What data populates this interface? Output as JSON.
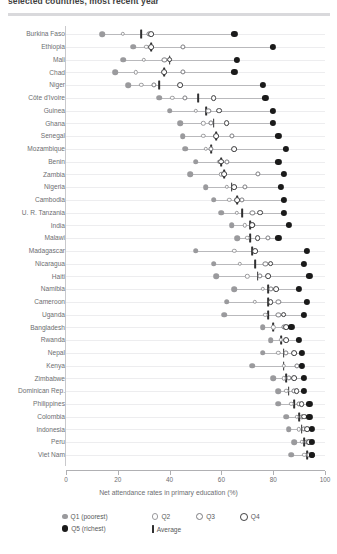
{
  "title": "selected countries, most recent year",
  "axis": {
    "x_title": "Net attendance rates in primary education (%)",
    "ticks": [
      0,
      20,
      40,
      60,
      80,
      100
    ],
    "xmin": 0,
    "xmax": 100
  },
  "legend": {
    "items": [
      {
        "key": "q1",
        "label": "Q1 (poorest)"
      },
      {
        "key": "q2",
        "label": "Q2"
      },
      {
        "key": "q3",
        "label": "Q3"
      },
      {
        "key": "q4",
        "label": "Q4"
      },
      {
        "key": "q5",
        "label": "Q5 (richest)"
      },
      {
        "key": "avg",
        "label": "Average"
      }
    ]
  },
  "colors": {
    "q1": "#9a9a9d",
    "q2": "#9a9a9d",
    "q3": "#7c7c80",
    "q4": "#3c3c3e",
    "q5": "#1a1a1a",
    "avg": "#303031",
    "connector": "#b9b9bc",
    "gridline": "#ededef",
    "axis": "#b0b0b3",
    "text": "#6d6e71",
    "rule": "#d9d9dc"
  },
  "chart_data": {
    "type": "scatter",
    "title": "selected countries, most recent year",
    "xlabel": "Net attendance rates in primary education (%)",
    "ylabel": "",
    "xlim": [
      0,
      100
    ],
    "grid": true,
    "legend_position": "bottom",
    "series_names": [
      "Q1 (poorest)",
      "Q2",
      "Q3",
      "Q4",
      "Q5 (richest)",
      "Average"
    ],
    "categories": [
      "Burkina Faso",
      "Ethiopia",
      "Mali",
      "Chad",
      "Niger",
      "Côte d'Ivoire",
      "Guinea",
      "Ghana",
      "Senegal",
      "Mozambique",
      "Benin",
      "Zambia",
      "Nigeria",
      "Cambodia",
      "U. R. Tanzania",
      "India",
      "Malawi",
      "Madagascar",
      "Nicaragua",
      "Haiti",
      "Namibia",
      "Cameroon",
      "Uganda",
      "Bangladesh",
      "Rwanda",
      "Nepal",
      "Kenya",
      "Zimbabwe",
      "Dominican Rep.",
      "Philippines",
      "Colombia",
      "Indonesia",
      "Peru",
      "Viet Nam"
    ],
    "rows": [
      {
        "country": "Burkina Faso",
        "q1": 14,
        "q2": 22,
        "q3": 32,
        "q4": 33,
        "q5": 65,
        "avg": 29
      },
      {
        "country": "Ethiopia",
        "q1": 26,
        "q2": 31,
        "q3": 45,
        "q4": 33,
        "q5": 80,
        "avg": 33
      },
      {
        "country": "Mali",
        "q1": 22,
        "q2": 30,
        "q3": 38,
        "q4": 40,
        "q5": 66,
        "avg": 40
      },
      {
        "country": "Chad",
        "q1": 19,
        "q2": 27,
        "q3": 45,
        "q4": 38,
        "q5": 65,
        "avg": 38
      },
      {
        "country": "Niger",
        "q1": 24,
        "q2": 29,
        "q3": 34,
        "q4": 44,
        "q5": 76,
        "avg": 36
      },
      {
        "country": "Côte d'Ivoire",
        "q1": 36,
        "q2": 41,
        "q3": 46,
        "q4": 57,
        "q5": 77,
        "avg": 51
      },
      {
        "country": "Guinea",
        "q1": 40,
        "q2": 50,
        "q3": 55,
        "q4": 59,
        "q5": 80,
        "avg": 54
      },
      {
        "country": "Ghana",
        "q1": 44,
        "q2": 53,
        "q3": 56,
        "q4": 62,
        "q5": 80,
        "avg": 57
      },
      {
        "country": "Senegal",
        "q1": 45,
        "q2": 53,
        "q3": 64,
        "q4": 58,
        "q5": 82,
        "avg": 58
      },
      {
        "country": "Mozambique",
        "q1": 46,
        "q2": 54,
        "q3": 56,
        "q4": 65,
        "q5": 85,
        "avg": 56
      },
      {
        "country": "Benin",
        "q1": 50,
        "q2": 59,
        "q3": 62,
        "q4": 60,
        "q5": 82,
        "avg": 60
      },
      {
        "country": "Zambia",
        "q1": 48,
        "q2": 60,
        "q3": 74,
        "q4": 61,
        "q5": 84,
        "avg": 61
      },
      {
        "country": "Nigeria",
        "q1": 54,
        "q2": 62,
        "q3": 69,
        "q4": 65,
        "q5": 83,
        "avg": 64
      },
      {
        "country": "Cambodia",
        "q1": 57,
        "q2": 63,
        "q3": 68,
        "q4": 66,
        "q5": 84,
        "avg": 66
      },
      {
        "country": "U. R. Tanzania",
        "q1": 60,
        "q2": 66,
        "q3": 72,
        "q4": 75,
        "q5": 84,
        "avg": 68
      },
      {
        "country": "India",
        "q1": 64,
        "q2": 69,
        "q3": 72,
        "q4": 72,
        "q5": 86,
        "avg": 71
      },
      {
        "country": "Malawi",
        "q1": 66,
        "q2": 70,
        "q3": 78,
        "q4": 74,
        "q5": 82,
        "avg": 71
      },
      {
        "country": "Madagascar",
        "q1": 50,
        "q2": 65,
        "q3": 73,
        "q4": 73,
        "q5": 93,
        "avg": 72
      },
      {
        "country": "Nicaragua",
        "q1": 57,
        "q2": 67,
        "q3": 77,
        "q4": 79,
        "q5": 92,
        "avg": 73
      },
      {
        "country": "Haiti",
        "q1": 58,
        "q2": 70,
        "q3": 75,
        "q4": 78,
        "q5": 94,
        "avg": 74
      },
      {
        "country": "Namibia",
        "q1": 65,
        "q2": 76,
        "q3": 79,
        "q4": 81,
        "q5": 90,
        "avg": 78
      },
      {
        "country": "Cameroon",
        "q1": 62,
        "q2": 73,
        "q3": 82,
        "q4": 79,
        "q5": 93,
        "avg": 78
      },
      {
        "country": "Uganda",
        "q1": 61,
        "q2": 77,
        "q3": 82,
        "q4": 84,
        "q5": 92,
        "avg": 78
      },
      {
        "country": "Bangladesh",
        "q1": 76,
        "q2": 80,
        "q3": 84,
        "q4": 85,
        "q5": 87,
        "avg": 80
      },
      {
        "country": "Rwanda",
        "q1": 79,
        "q2": 83,
        "q3": 85,
        "q4": 85,
        "q5": 90,
        "avg": 83
      },
      {
        "country": "Nepal",
        "q1": 76,
        "q2": 82,
        "q3": 85,
        "q4": 88,
        "q5": 91,
        "avg": 84
      },
      {
        "country": "Kenya",
        "q1": 72,
        "q2": 84,
        "q3": 89,
        "q4": 91,
        "q5": 91,
        "avg": 84
      },
      {
        "country": "Zimbabwe",
        "q1": 80,
        "q2": 84,
        "q3": 86,
        "q4": 88,
        "q5": 92,
        "avg": 85
      },
      {
        "country": "Dominican Rep.",
        "q1": 82,
        "q2": 85,
        "q3": 88,
        "q4": 89,
        "q5": 92,
        "avg": 86
      },
      {
        "country": "Philippines",
        "q1": 82,
        "q2": 87,
        "q3": 90,
        "q4": 91,
        "q5": 94,
        "avg": 88
      },
      {
        "country": "Colombia",
        "q1": 85,
        "q2": 89,
        "q3": 91,
        "q4": 92,
        "q5": 94,
        "avg": 90
      },
      {
        "country": "Indonesia",
        "q1": 86,
        "q2": 90,
        "q3": 92,
        "q4": 93,
        "q5": 95,
        "avg": 91
      },
      {
        "country": "Peru",
        "q1": 88,
        "q2": 91,
        "q3": 93,
        "q4": 94,
        "q5": 95,
        "avg": 92
      },
      {
        "country": "Viet Nam",
        "q1": 87,
        "q2": 92,
        "q3": 94,
        "q4": 95,
        "q5": 95,
        "avg": 93
      }
    ]
  }
}
